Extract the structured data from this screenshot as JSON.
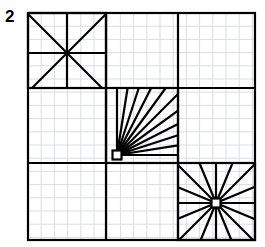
{
  "figure": {
    "label": "2",
    "title": ""
  },
  "canvas": {
    "width": 265,
    "height": 247,
    "background_color": "#ffffff"
  },
  "grid": {
    "color": "#d9dde3",
    "cell_size": 13.2,
    "stroke_width": 1,
    "visible": true,
    "origin_x": 28,
    "origin_y": 13
  },
  "frame": {
    "x": 28,
    "y": 13,
    "width": 227,
    "height": 227,
    "stroke_color": "#000000",
    "stroke_width": 2.2
  },
  "dividers": {
    "stroke_color": "#000000",
    "stroke_width": 2.2,
    "vertical": [
      106,
      178
    ],
    "horizontal": [
      88,
      163
    ]
  },
  "cells": [
    {
      "name": "top-left",
      "x": 28,
      "y": 13,
      "w": 78,
      "h": 75,
      "figure": "asterisk-8"
    },
    {
      "name": "top-middle",
      "x": 106,
      "y": 13,
      "w": 72,
      "h": 75,
      "figure": "empty"
    },
    {
      "name": "top-right",
      "x": 178,
      "y": 13,
      "w": 77,
      "h": 75,
      "figure": "empty"
    },
    {
      "name": "middle-left",
      "x": 28,
      "y": 88,
      "w": 78,
      "h": 75,
      "figure": "empty"
    },
    {
      "name": "middle-center",
      "x": 106,
      "y": 88,
      "w": 72,
      "h": 75,
      "figure": "quarter-fan"
    },
    {
      "name": "middle-right",
      "x": 178,
      "y": 88,
      "w": 77,
      "h": 75,
      "figure": "empty"
    },
    {
      "name": "bottom-left",
      "x": 28,
      "y": 163,
      "w": 78,
      "h": 77,
      "figure": "empty"
    },
    {
      "name": "bottom-middle",
      "x": 106,
      "y": 163,
      "w": 72,
      "h": 77,
      "figure": "empty"
    },
    {
      "name": "bottom-right",
      "x": 178,
      "y": 163,
      "w": 77,
      "h": 77,
      "figure": "starburst-16"
    }
  ],
  "figures": {
    "asterisk_top_left": {
      "type": "asterisk",
      "center_x": 67,
      "center_y": 53,
      "box": {
        "x": 28,
        "y": 13,
        "w": 78,
        "h": 75
      },
      "ray_count": 8,
      "rays_note": "two diagonals, one vertical, one horizontal through the center",
      "stroke_width": 2.2,
      "stroke_color": "#000000"
    },
    "fan_middle_center": {
      "type": "quarter-fan",
      "pivot_x": 117,
      "pivot_y": 155,
      "box": {
        "x": 106,
        "y": 88,
        "w": 72,
        "h": 75
      },
      "ray_count": 11,
      "sweep_degrees": 90,
      "hub_square_size": 9,
      "stroke_width": 2.2,
      "stroke_color": "#000000"
    },
    "starburst_bottom_right": {
      "type": "starburst",
      "center_x": 216,
      "center_y": 203,
      "box": {
        "x": 178,
        "y": 163,
        "w": 77,
        "h": 77
      },
      "ray_count": 16,
      "sweep_degrees": 360,
      "hub_square_size": 9,
      "stroke_width": 2.2,
      "stroke_color": "#000000"
    }
  },
  "style": {
    "line_color": "#000000",
    "grid_color": "#d9dde3",
    "label_color": "#000000"
  }
}
